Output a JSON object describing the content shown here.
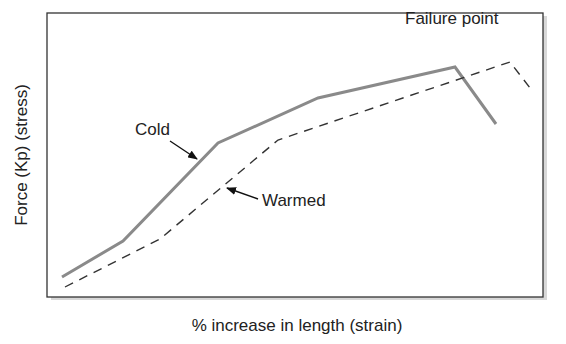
{
  "chart_data": {
    "type": "line",
    "title": "",
    "xlabel": "% increase in length (strain)",
    "ylabel": "Force (Kp) (stress)",
    "grid": false,
    "legend": "none (inline annotations)",
    "series": [
      {
        "name": "Cold",
        "style": "solid",
        "color": "#888888",
        "points_px": [
          [
            62,
            277
          ],
          [
            123,
            241
          ],
          [
            218,
            143
          ],
          [
            318,
            98
          ],
          [
            455,
            67
          ],
          [
            496,
            124
          ]
        ]
      },
      {
        "name": "Warmed",
        "style": "dashed",
        "color": "#333333",
        "points_px": [
          [
            65,
            287
          ],
          [
            160,
            239
          ],
          [
            278,
            140
          ],
          [
            510,
            62
          ],
          [
            530,
            88
          ]
        ]
      }
    ],
    "annotations": [
      {
        "text": "Cold",
        "x": 135,
        "y": 135,
        "arrow_from": [
          170,
          141
        ],
        "arrow_to": [
          197,
          159
        ]
      },
      {
        "text": "Warmed",
        "x": 262,
        "y": 206,
        "arrow_from": [
          258,
          199
        ],
        "arrow_to": [
          227,
          188
        ]
      },
      {
        "text": "Failure point",
        "x": 405,
        "y": 24
      }
    ]
  },
  "labels": {
    "xlabel": "% increase in length (strain)",
    "ylabel": "Force (Kp) (stress)",
    "cold": "Cold",
    "warmed": "Warmed",
    "failure": "Failure point"
  }
}
